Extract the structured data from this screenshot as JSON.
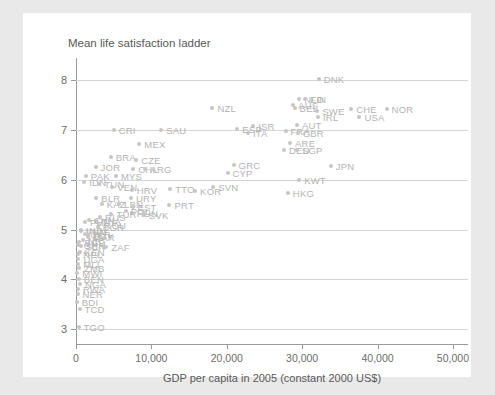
{
  "chart_data": {
    "type": "scatter",
    "title": "Mean life satisfaction ladder",
    "xlabel": "GDP per capita in 2005 (constant 2000 US$)",
    "ylabel": "",
    "xlim": [
      0,
      52000
    ],
    "ylim": [
      2.7,
      8.45
    ],
    "grid": true,
    "legend": "none",
    "xticks": [
      "0",
      "10,000",
      "20,000",
      "30,000",
      "40,000",
      "50,000"
    ],
    "xtick_values": [
      0,
      10000,
      20000,
      30000,
      40000,
      50000
    ],
    "yticks": [
      "3",
      "4",
      "5",
      "6",
      "7",
      "8"
    ],
    "ytick_values": [
      3,
      4,
      5,
      6,
      7,
      8
    ],
    "point_color": "#c6c6c6",
    "label_color": "#b4b4b4",
    "series": [
      {
        "name": "Countries",
        "points": [
          {
            "label": "DNK",
            "x": 32200,
            "y": 8.02
          },
          {
            "label": "NLD",
            "x": 29600,
            "y": 7.62
          },
          {
            "label": "FIN",
            "x": 30400,
            "y": 7.62
          },
          {
            "label": "AUS",
            "x": 28800,
            "y": 7.5
          },
          {
            "label": "BEL",
            "x": 29000,
            "y": 7.45
          },
          {
            "label": "SWE",
            "x": 32000,
            "y": 7.38
          },
          {
            "label": "CHE",
            "x": 36500,
            "y": 7.42
          },
          {
            "label": "NOR",
            "x": 41200,
            "y": 7.42
          },
          {
            "label": "IRL",
            "x": 32100,
            "y": 7.27
          },
          {
            "label": "USA",
            "x": 37600,
            "y": 7.26
          },
          {
            "label": "NZL",
            "x": 18100,
            "y": 7.44
          },
          {
            "label": "ISR",
            "x": 23500,
            "y": 7.08
          },
          {
            "label": "ESP",
            "x": 21400,
            "y": 7.02
          },
          {
            "label": "AUT",
            "x": 29300,
            "y": 7.1
          },
          {
            "label": "ITA",
            "x": 22800,
            "y": 6.95
          },
          {
            "label": "FRA",
            "x": 27800,
            "y": 6.99
          },
          {
            "label": "GBR",
            "x": 29400,
            "y": 6.94
          },
          {
            "label": "CRI",
            "x": 5000,
            "y": 7.0
          },
          {
            "label": "SAU",
            "x": 11300,
            "y": 7.0
          },
          {
            "label": "ARE",
            "x": 28400,
            "y": 6.75
          },
          {
            "label": "DEU",
            "x": 27600,
            "y": 6.6
          },
          {
            "label": "SGP",
            "x": 29300,
            "y": 6.6
          },
          {
            "label": "JPN",
            "x": 33800,
            "y": 6.27
          },
          {
            "label": "MEX",
            "x": 8400,
            "y": 6.72
          },
          {
            "label": "BRA",
            "x": 4600,
            "y": 6.45
          },
          {
            "label": "CZE",
            "x": 8000,
            "y": 6.4
          },
          {
            "label": "GRC",
            "x": 20900,
            "y": 6.3
          },
          {
            "label": "CYP",
            "x": 20100,
            "y": 6.13
          },
          {
            "label": "JOR",
            "x": 2600,
            "y": 6.25
          },
          {
            "label": "CHL",
            "x": 7600,
            "y": 6.22
          },
          {
            "label": "ARG",
            "x": 9200,
            "y": 6.22
          },
          {
            "label": "PAK",
            "x": 1300,
            "y": 6.08
          },
          {
            "label": "MYS",
            "x": 5300,
            "y": 6.08
          },
          {
            "label": "KWT",
            "x": 29600,
            "y": 6.0
          },
          {
            "label": "IDN",
            "x": 1100,
            "y": 5.95
          },
          {
            "label": "TUN",
            "x": 3100,
            "y": 5.92
          },
          {
            "label": "SVN",
            "x": 18200,
            "y": 5.85
          },
          {
            "label": "VEN",
            "x": 4800,
            "y": 5.85
          },
          {
            "label": "HRV",
            "x": 7400,
            "y": 5.79
          },
          {
            "label": "TTO",
            "x": 12500,
            "y": 5.81
          },
          {
            "label": "KOR",
            "x": 15800,
            "y": 5.77
          },
          {
            "label": "HKG",
            "x": 28100,
            "y": 5.74
          },
          {
            "label": "BLR",
            "x": 2700,
            "y": 5.64
          },
          {
            "label": "URY",
            "x": 7300,
            "y": 5.64
          },
          {
            "label": "KAZ",
            "x": 3400,
            "y": 5.52
          },
          {
            "label": "LBN",
            "x": 5700,
            "y": 5.52
          },
          {
            "label": "PRT",
            "x": 12400,
            "y": 5.49
          },
          {
            "label": "EST",
            "x": 7500,
            "y": 5.45
          },
          {
            "label": "POL",
            "x": 6600,
            "y": 5.38
          },
          {
            "label": "HUN",
            "x": 7400,
            "y": 5.34
          },
          {
            "label": "SVK",
            "x": 9000,
            "y": 5.3
          },
          {
            "label": "TUR",
            "x": 4700,
            "y": 5.32
          },
          {
            "label": "RUS",
            "x": 3200,
            "y": 5.25
          },
          {
            "label": "CHN",
            "x": 1700,
            "y": 5.2
          },
          {
            "label": "THA",
            "x": 2700,
            "y": 5.18
          },
          {
            "label": "PHL",
            "x": 1200,
            "y": 5.15
          },
          {
            "label": "ROU",
            "x": 3100,
            "y": 5.1
          },
          {
            "label": "BGR",
            "x": 2900,
            "y": 5.05
          },
          {
            "label": "IND",
            "x": 700,
            "y": 5.0
          },
          {
            "label": "VNM",
            "x": 600,
            "y": 4.98
          },
          {
            "label": "UKR",
            "x": 1200,
            "y": 4.92
          },
          {
            "label": "EGY",
            "x": 1600,
            "y": 4.88
          },
          {
            "label": "MAR",
            "x": 1600,
            "y": 4.85
          },
          {
            "label": "NIC",
            "x": 900,
            "y": 4.8
          },
          {
            "label": "BGD",
            "x": 450,
            "y": 4.75
          },
          {
            "label": "GHA",
            "x": 330,
            "y": 4.7
          },
          {
            "label": "SEN",
            "x": 600,
            "y": 4.68
          },
          {
            "label": "ZAF",
            "x": 4000,
            "y": 4.65
          },
          {
            "label": "KEN",
            "x": 480,
            "y": 4.55
          },
          {
            "label": "NPL",
            "x": 280,
            "y": 4.5
          },
          {
            "label": "UGA",
            "x": 320,
            "y": 4.4
          },
          {
            "label": "MLI",
            "x": 300,
            "y": 4.3
          },
          {
            "label": "ZMB",
            "x": 400,
            "y": 4.22
          },
          {
            "label": "MWI",
            "x": 180,
            "y": 4.12
          },
          {
            "label": "BEN",
            "x": 380,
            "y": 4.0
          },
          {
            "label": "NGA",
            "x": 520,
            "y": 3.9
          },
          {
            "label": "RWA",
            "x": 260,
            "y": 3.8
          },
          {
            "label": "NER",
            "x": 200,
            "y": 3.7
          },
          {
            "label": "BDI",
            "x": 110,
            "y": 3.55
          },
          {
            "label": "TCD",
            "x": 470,
            "y": 3.4
          },
          {
            "label": "TGO",
            "x": 340,
            "y": 3.05
          }
        ]
      }
    ]
  }
}
